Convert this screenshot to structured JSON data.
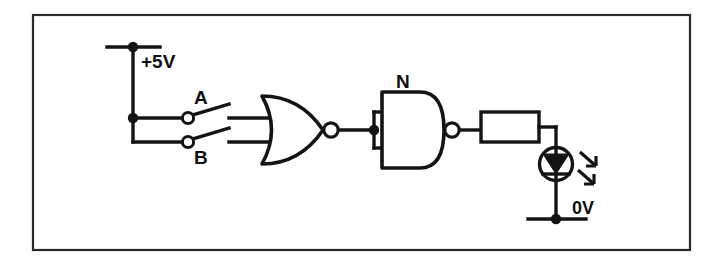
{
  "diagram": {
    "background_color": "#ffffff",
    "line_color": "#141414",
    "frame_color": "#2a2a2e",
    "labels": {
      "supply": "+5V",
      "ground": "0V",
      "switch_a": "A",
      "switch_b": "B",
      "nand_gate": "N"
    },
    "components": [
      {
        "name": "supply-rail",
        "type": "power-rail",
        "label": "+5V"
      },
      {
        "name": "switch-a",
        "type": "spst-switch",
        "label": "A",
        "state": "open"
      },
      {
        "name": "switch-b",
        "type": "spst-switch",
        "label": "B",
        "state": "open"
      },
      {
        "name": "nor-gate",
        "type": "nor-gate",
        "inputs": 2,
        "label": ""
      },
      {
        "name": "nand-gate",
        "type": "nand-gate",
        "inputs": 2,
        "label": "N",
        "note": "inputs tied together"
      },
      {
        "name": "resistor",
        "type": "resistor",
        "label": ""
      },
      {
        "name": "led",
        "type": "led",
        "label": ""
      },
      {
        "name": "ground-rail",
        "type": "ground-rail",
        "label": "0V"
      }
    ]
  }
}
